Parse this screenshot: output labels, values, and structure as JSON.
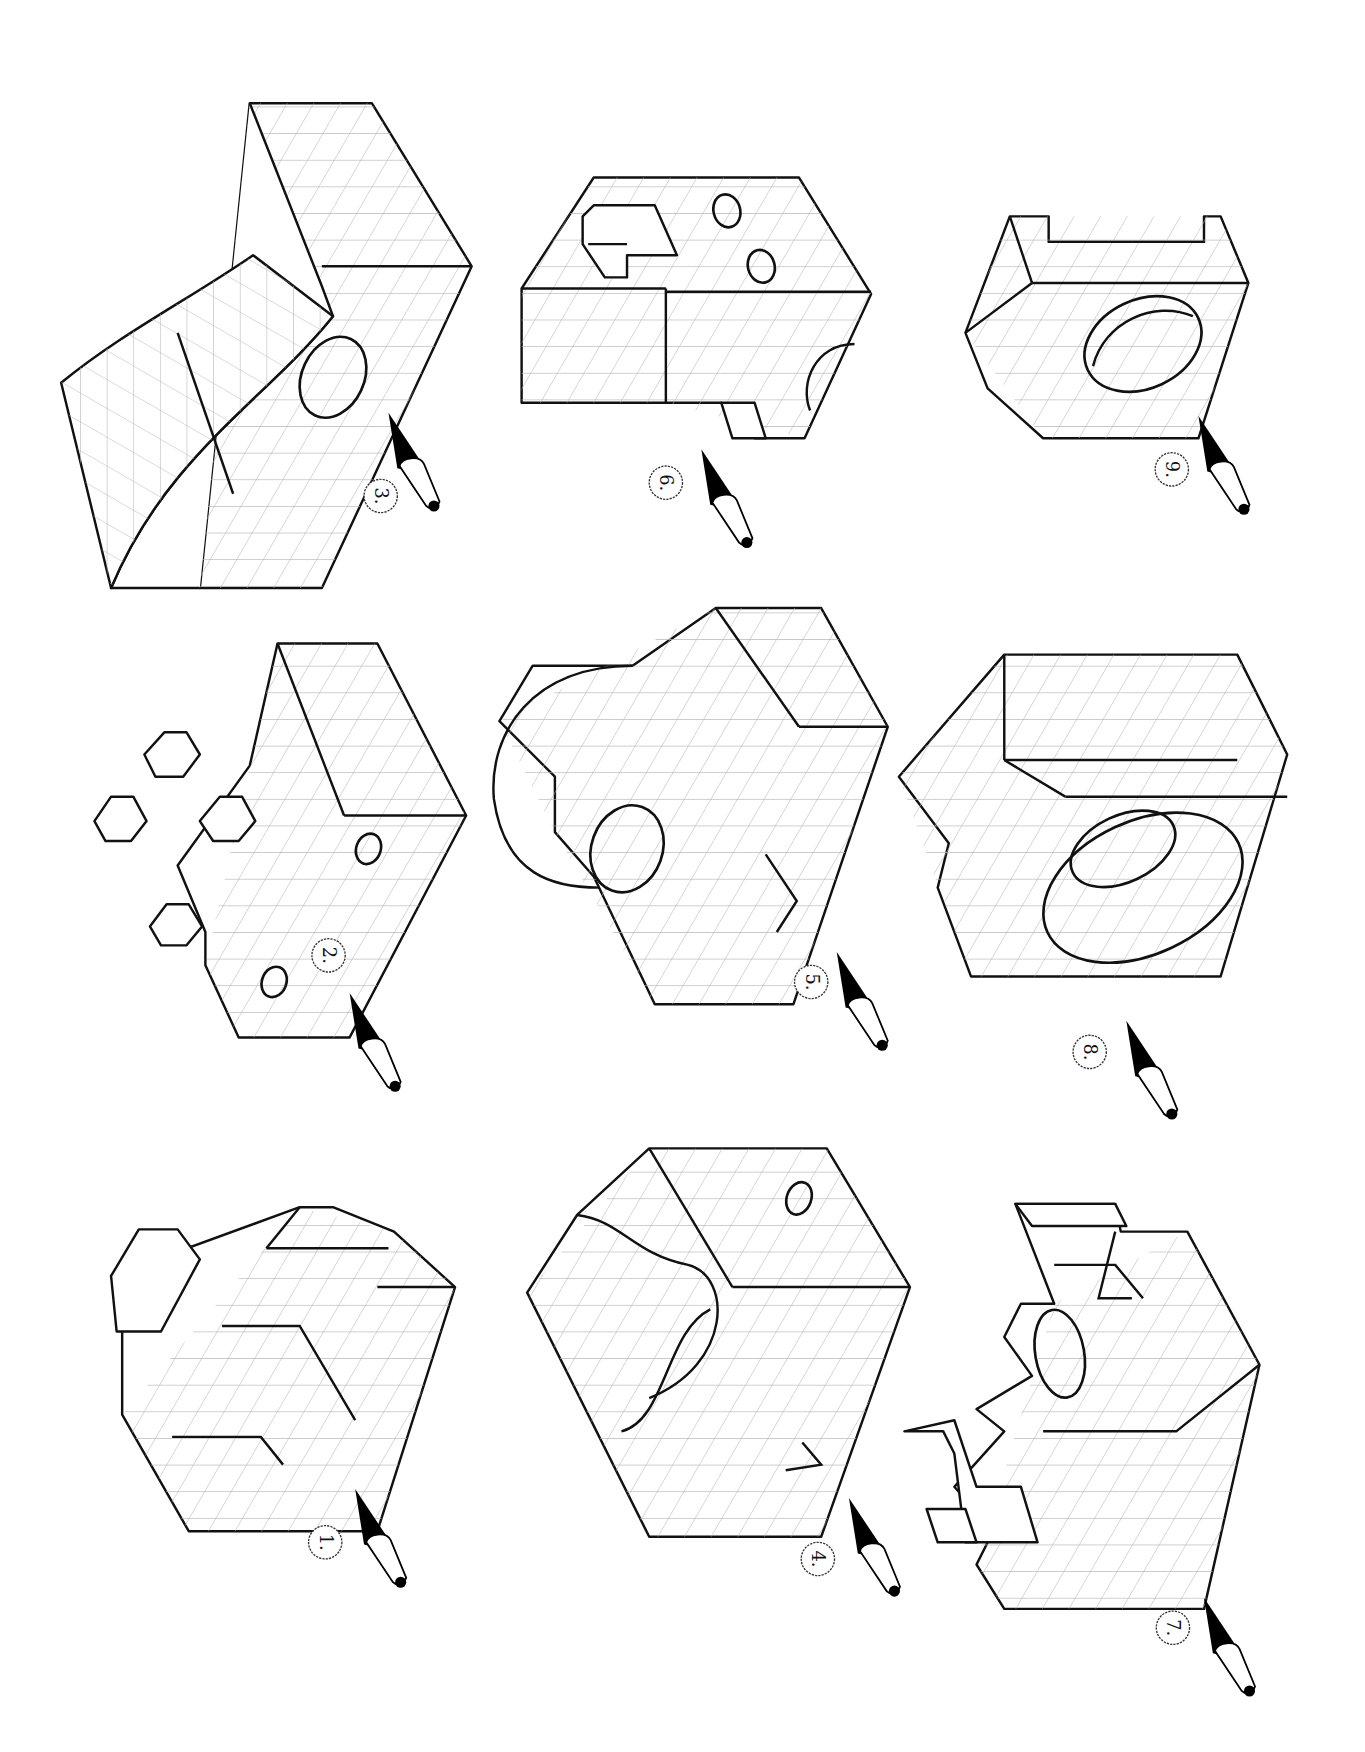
{
  "document": {
    "title": "Isometric views with viewing-direction arrows (orthographic projection exercise)",
    "orientation": "rotated 90 degrees (landscape sheet shown in portrait)",
    "colors": {
      "ink": "#111111",
      "grid": "#b5b5b5",
      "background": "#ffffff"
    }
  },
  "figures": [
    {
      "id": 1,
      "label": "1.",
      "description": "Stepped block with raised ribs",
      "arrow": "viewing-direction arrow"
    },
    {
      "id": 2,
      "label": "2.",
      "description": "Block with cross-shaped studs and two holes",
      "arrow": "viewing-direction arrow"
    },
    {
      "id": 3,
      "label": "3.",
      "description": "Curved L-shaped bracket with one hole",
      "arrow": "viewing-direction arrow"
    },
    {
      "id": 4,
      "label": "4.",
      "description": "Block with concave cutout, V-notch and small hole",
      "arrow": "viewing-direction arrow"
    },
    {
      "id": 5,
      "label": "5.",
      "description": "Block with rounded boss, hole and V-notch",
      "arrow": "viewing-direction arrow"
    },
    {
      "id": 6,
      "label": "6.",
      "description": "Block with slot, two holes and semicircular notch",
      "arrow": "viewing-direction arrow"
    },
    {
      "id": 7,
      "label": "7.",
      "description": "Base plate with uprights and elliptical hole",
      "arrow": "viewing-direction arrow"
    },
    {
      "id": 8,
      "label": "8.",
      "description": "Block with counterbored hole and V-groove",
      "arrow": "viewing-direction arrow"
    },
    {
      "id": 9,
      "label": "9.",
      "description": "U-channel block with inclined hole",
      "arrow": "viewing-direction arrow"
    }
  ]
}
